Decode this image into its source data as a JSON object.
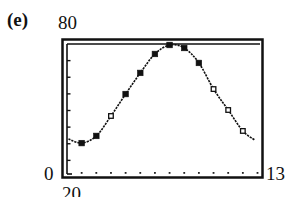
{
  "panel": {
    "label": "(e)"
  },
  "window": {
    "ymax_label": "80",
    "ymin_label": "0",
    "xmin_label": "20",
    "xmax_label": "13"
  },
  "chart_data": {
    "type": "scatter",
    "title": "(e)",
    "xlabel": "",
    "ylabel": "",
    "xlim": [
      0,
      13
    ],
    "ylim": [
      0,
      80
    ],
    "grid": false,
    "x_ticks": [
      1,
      2,
      3,
      4,
      5,
      6,
      7,
      8,
      9,
      10,
      11,
      12,
      13
    ],
    "y_ticks": [
      10,
      20,
      30,
      40,
      50,
      60,
      70
    ],
    "axis_labels_shown": {
      "ymax": "80",
      "ymin": "0",
      "xmax": "13",
      "below_axis": "20"
    },
    "series": [
      {
        "name": "data (filled markers)",
        "marker": "filled-square",
        "points": [
          [
            1,
            20.4
          ],
          [
            2,
            24.7
          ],
          [
            4,
            49.9
          ],
          [
            5,
            62.6
          ],
          [
            6,
            74.0
          ],
          [
            7,
            79.4
          ],
          [
            8,
            77.6
          ],
          [
            9,
            68.6
          ]
        ]
      },
      {
        "name": "data (open markers)",
        "marker": "open-square",
        "points": [
          [
            3,
            36.7
          ],
          [
            10,
            52.9
          ],
          [
            11,
            40.3
          ],
          [
            12,
            27.7
          ]
        ]
      },
      {
        "name": "fitted curve",
        "type": "line",
        "style": "dotted-solid",
        "points": [
          [
            0.1,
            22.9
          ],
          [
            1,
            20.4
          ],
          [
            2,
            24.7
          ],
          [
            3,
            36.7
          ],
          [
            4,
            49.9
          ],
          [
            5,
            62.6
          ],
          [
            6,
            74.0
          ],
          [
            7,
            79.4
          ],
          [
            8,
            77.6
          ],
          [
            9,
            68.6
          ],
          [
            10,
            52.9
          ],
          [
            11,
            40.3
          ],
          [
            12,
            27.7
          ],
          [
            12.8,
            22.3
          ]
        ]
      }
    ],
    "legend": null
  }
}
